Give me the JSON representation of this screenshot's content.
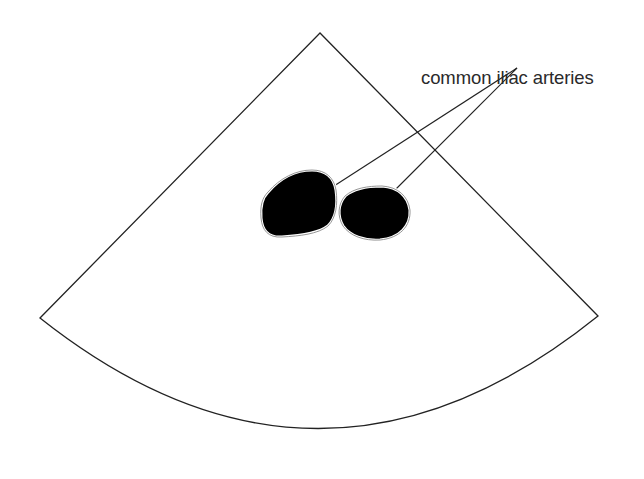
{
  "diagram": {
    "label": "common iliac arteries",
    "colors": {
      "background": "#ffffff",
      "outline": "#222222",
      "vessel_fill": "#000000",
      "vessel_halo": "#9a9a9a",
      "text": "#2a2a2a"
    },
    "structures": [
      {
        "name": "left common iliac artery"
      },
      {
        "name": "right common iliac artery"
      }
    ]
  }
}
